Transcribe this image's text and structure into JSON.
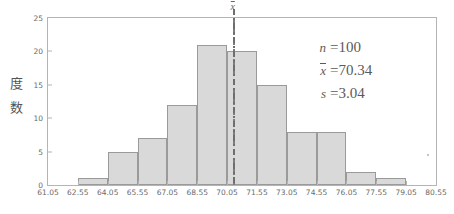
{
  "chart_data": {
    "type": "bar",
    "title": "",
    "xlabel": "",
    "ylabel": "度数",
    "ylim": [
      0,
      25
    ],
    "xlim": [
      61.05,
      80.55
    ],
    "grid": false,
    "bin_width": 1.5,
    "bin_edges": [
      61.05,
      62.55,
      64.05,
      65.55,
      67.05,
      68.55,
      70.05,
      71.55,
      73.05,
      74.55,
      76.05,
      77.55,
      79.05,
      80.55
    ],
    "categories": [
      "61.05-62.55",
      "62.55-64.05",
      "64.05-65.55",
      "65.55-67.05",
      "67.05-68.55",
      "68.55-70.05",
      "70.05-71.55",
      "71.55-73.05",
      "73.05-74.55",
      "74.55-76.05",
      "76.05-77.55",
      "77.55-79.05",
      "79.05-80.55"
    ],
    "values": [
      0,
      1,
      5,
      7,
      12,
      21,
      20,
      15,
      8,
      8,
      2,
      1,
      0
    ],
    "xticks": [
      "61.05",
      "62.55",
      "64.05",
      "65.55",
      "67.05",
      "68.55",
      "70.05",
      "71.55",
      "73.05",
      "74.55",
      "76.05",
      "77.55",
      "79.05",
      "80.55"
    ],
    "yticks": [
      "0",
      "5",
      "10",
      "15",
      "20",
      "25"
    ],
    "ytick_values": [
      0,
      5,
      10,
      15,
      20,
      25
    ],
    "annotations": [
      {
        "name": "mean-line",
        "label": "x̄",
        "x_value": 70.34,
        "style": "dash-dot-vertical"
      }
    ],
    "bar_fill_color": "#d9d9d9",
    "bar_edge_color": "#9a9a9a",
    "axis_color": "#b4b4b4"
  },
  "stats": {
    "n": {
      "symbol": "n",
      "equals": "=",
      "value": "100"
    },
    "mean": {
      "symbol": "x",
      "overbar": true,
      "equals": "=",
      "value": "70.34"
    },
    "sd": {
      "symbol": "s",
      "equals": "=",
      "value": "3.04"
    }
  },
  "axis": {
    "y_title_chars": [
      "度",
      "数"
    ]
  },
  "mean_marker": {
    "label": "x"
  }
}
